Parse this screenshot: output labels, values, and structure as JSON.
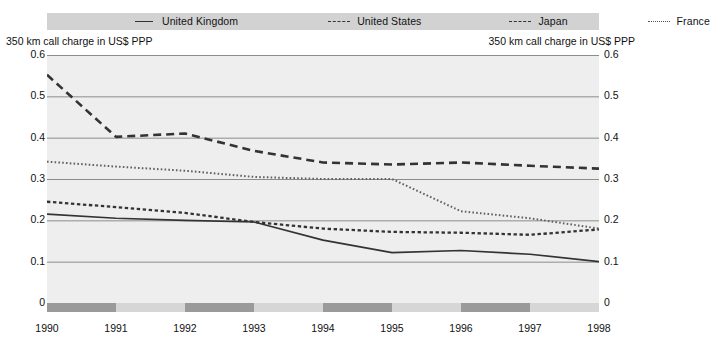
{
  "legend": {
    "items": [
      {
        "label": "United Kingdom",
        "style": "solid",
        "icon": "solid-line-swatch"
      },
      {
        "label": "United States",
        "style": "dash-small",
        "icon": "dashed-line-swatch"
      },
      {
        "label": "Japan",
        "style": "dash-large",
        "icon": "long-dashed-line-swatch"
      },
      {
        "label": "France",
        "style": "dotted",
        "icon": "dotted-line-swatch"
      }
    ]
  },
  "axis": {
    "left_caption": "350 km call charge in US$ PPP",
    "right_caption": "350 km call charge in US$ PPP",
    "y_ticks": [
      "0.6",
      "0.5",
      "0.4",
      "0.3",
      "0.2",
      "0.1",
      "0"
    ],
    "x_ticks": [
      "1990",
      "1991",
      "1992",
      "1993",
      "1994",
      "1995",
      "1996",
      "1997",
      "1998"
    ]
  },
  "colors": {
    "plot_background": "#eeeeee",
    "legend_background": "#d2d2d2",
    "gridline": "#8c8c8c",
    "series_line": "#333333",
    "strip_dark": "#9a9a9a",
    "strip_light": "#d6d6d6"
  },
  "chart_data": {
    "type": "line",
    "title": "",
    "subtitle": "",
    "xlabel": "",
    "ylabel": "350 km call charge in US$ PPP",
    "ylim": [
      0,
      0.6
    ],
    "yticks": [
      0,
      0.1,
      0.2,
      0.3,
      0.4,
      0.5,
      0.6
    ],
    "grid": true,
    "legend_position": "top",
    "x": [
      1990,
      1991,
      1992,
      1993,
      1994,
      1995,
      1996,
      1997,
      1998
    ],
    "series": [
      {
        "name": "United Kingdom",
        "style": "solid",
        "values": [
          0.215,
          0.205,
          0.2,
          0.196,
          0.152,
          0.122,
          0.127,
          0.118,
          0.1
        ]
      },
      {
        "name": "United States",
        "style": "dash-small",
        "values": [
          0.245,
          0.232,
          0.218,
          0.196,
          0.18,
          0.172,
          0.17,
          0.165,
          0.178
        ]
      },
      {
        "name": "Japan",
        "style": "dash-large",
        "values": [
          0.552,
          0.402,
          0.41,
          0.368,
          0.34,
          0.335,
          0.34,
          0.332,
          0.325
        ]
      },
      {
        "name": "France",
        "style": "dotted",
        "values": [
          0.342,
          0.33,
          0.32,
          0.305,
          0.3,
          0.3,
          0.222,
          0.205,
          0.18
        ]
      }
    ]
  },
  "year_strip": {
    "segments": [
      {
        "from": 1990,
        "to": 1991,
        "shade": "dark"
      },
      {
        "from": 1991,
        "to": 1992,
        "shade": "light"
      },
      {
        "from": 1992,
        "to": 1993,
        "shade": "dark"
      },
      {
        "from": 1993,
        "to": 1994,
        "shade": "light"
      },
      {
        "from": 1994,
        "to": 1995,
        "shade": "dark"
      },
      {
        "from": 1995,
        "to": 1996,
        "shade": "light"
      },
      {
        "from": 1996,
        "to": 1997,
        "shade": "dark"
      },
      {
        "from": 1997,
        "to": 1998,
        "shade": "light"
      }
    ]
  }
}
